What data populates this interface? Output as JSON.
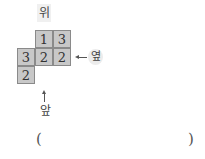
{
  "labels": {
    "top": "위",
    "side": "옆",
    "front": "앞"
  },
  "grid": {
    "cells": [
      {
        "row": 0,
        "col": 1,
        "value": "1"
      },
      {
        "row": 0,
        "col": 2,
        "value": "3"
      },
      {
        "row": 1,
        "col": 0,
        "value": "3"
      },
      {
        "row": 1,
        "col": 1,
        "value": "2"
      },
      {
        "row": 1,
        "col": 2,
        "value": "2"
      },
      {
        "row": 2,
        "col": 0,
        "value": "2"
      }
    ]
  },
  "answer": {
    "open_paren": "(",
    "close_paren": ")",
    "value": ""
  }
}
